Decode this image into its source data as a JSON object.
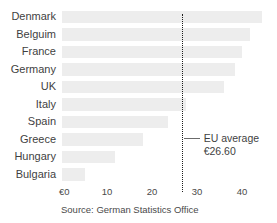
{
  "chart_data": {
    "type": "bar",
    "orientation": "horizontal",
    "title": "",
    "xlabel": "",
    "ylabel": "",
    "categories": [
      "Denmark",
      "Belguim",
      "France",
      "Germany",
      "UK",
      "Italy",
      "Spain",
      "Greece",
      "Hungary",
      "Bulgaria"
    ],
    "values": [
      44.5,
      41.8,
      40.0,
      38.5,
      36.0,
      27.5,
      23.5,
      18.0,
      11.8,
      5.0
    ],
    "xlim": [
      0,
      40
    ],
    "xticks": [
      0,
      10,
      20,
      30,
      40
    ],
    "xtick_labels": [
      "€0",
      "10",
      "20",
      "30",
      "40"
    ],
    "grid": false,
    "legend": null,
    "bar_color": "#ededed",
    "annotations": [
      {
        "name": "eu-average-reference-line",
        "value": 26.6,
        "label": "EU average",
        "sublabel": "€26.60",
        "style": "dotted-vertical",
        "color": "#1d1d1d"
      }
    ],
    "source": "Source: German Statistics Office"
  },
  "axis": {
    "ticks": [
      {
        "label": "€0",
        "value": 0
      },
      {
        "label": "10",
        "value": 10
      },
      {
        "label": "20",
        "value": 20
      },
      {
        "label": "30",
        "value": 30
      },
      {
        "label": "40",
        "value": 40
      }
    ]
  },
  "average": {
    "label": "EU average",
    "value_label": "€26.60"
  },
  "footer": {
    "source": "Source: German Statistics Office"
  }
}
